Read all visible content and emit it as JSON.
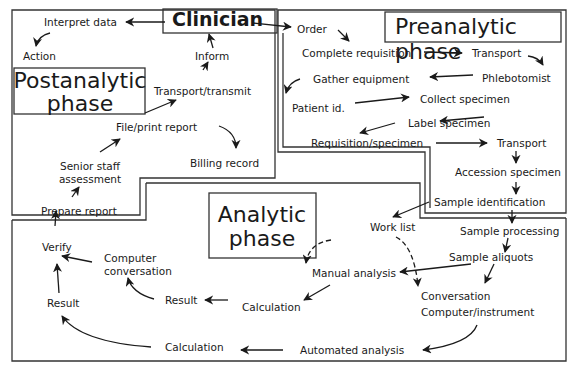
{
  "titles": {
    "clinician": "Clinician",
    "preanalytic": "Preanalytic phase",
    "postanalytic_line1": "Postanalytic",
    "postanalytic_line2": "phase",
    "analytic_line1": "Analytic",
    "analytic_line2": "phase"
  },
  "preanalytic": {
    "order": "Order",
    "complete_requisition": "Complete requisition",
    "transport_1": "Transport",
    "phlebotomist": "Phlebotomist",
    "gather_equipment": "Gather equipment",
    "patient_id": "Patient id.",
    "collect_specimen": "Collect specimen",
    "label_specimen": "Label specimen",
    "requisition_specimen": "Requisition/specimen",
    "transport_2": "Transport",
    "accession_specimen": "Accession specimen",
    "sample_identification": "Sample identification"
  },
  "analytic": {
    "work_list": "Work list",
    "sample_processing": "Sample processing",
    "sample_aliquots": "Sample aliquots",
    "manual_analysis": "Manual analysis",
    "conversation": "Conversation",
    "computer_instrument": "Computer/instrument",
    "calculation_1": "Calculation",
    "result_1": "Result",
    "computer_conversation_line1": "Computer",
    "computer_conversation_line2": "conversation",
    "automated_analysis": "Automated analysis",
    "calculation_2": "Calculation",
    "result_2": "Result",
    "verify": "Verify"
  },
  "postanalytic": {
    "interpret_data": "Interpret data",
    "action": "Action",
    "inform": "Inform",
    "transport_transmit": "Transport/transmit",
    "file_print_report": "File/print report",
    "billing_record": "Billing record",
    "senior_staff_line1": "Senior staff",
    "senior_staff_line2": "assessment",
    "prepare_report": "Prepare report"
  }
}
